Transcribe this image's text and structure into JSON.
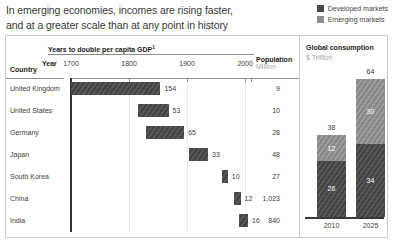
{
  "title": {
    "line1": "In emerging economies, incomes are rising faster,",
    "line2": "and at a greater scale than at any point in history"
  },
  "legend": {
    "items": [
      {
        "label": "Developed markets",
        "color": "#4a4a4a"
      },
      {
        "label": "Emerging markets",
        "color": "#8f8f8f"
      }
    ]
  },
  "chart_data": [
    {
      "type": "bar",
      "title": "Years to double per capita GDP",
      "footnote_marker": "1",
      "axis_label": "Year",
      "axis_ticks": [
        1700,
        1800,
        1900,
        2000
      ],
      "axis_range": [
        1700,
        2010
      ],
      "country_column_label": "Country",
      "population_column_label": "Population",
      "population_column_unit": "Million",
      "rows": [
        {
          "country": "United Kingdom",
          "years": 154,
          "start_year": 1700,
          "end_year": 1854,
          "population": "9"
        },
        {
          "country": "United States",
          "years": 53,
          "start_year": 1815,
          "end_year": 1868,
          "population": "10"
        },
        {
          "country": "Germany",
          "years": 65,
          "start_year": 1830,
          "end_year": 1895,
          "population": "28"
        },
        {
          "country": "Japan",
          "years": 33,
          "start_year": 1903,
          "end_year": 1936,
          "population": "48"
        },
        {
          "country": "South Korea",
          "years": 10,
          "start_year": 1960,
          "end_year": 1970,
          "population": "27"
        },
        {
          "country": "China",
          "years": 12,
          "start_year": 1980,
          "end_year": 1992,
          "population": "1,023"
        },
        {
          "country": "India",
          "years": 16,
          "start_year": 1989,
          "end_year": 2005,
          "population": "840"
        }
      ]
    },
    {
      "type": "stacked-bar",
      "title": "Global consumption",
      "unit": "$ Trillion",
      "categories": [
        "2010",
        "2025"
      ],
      "series": [
        {
          "name": "Developed markets",
          "values": [
            26,
            34
          ],
          "color": "#4a4a4a"
        },
        {
          "name": "Emerging markets",
          "values": [
            12,
            30
          ],
          "color": "#8f8f8f"
        }
      ],
      "totals": [
        38,
        64
      ]
    }
  ],
  "colors": {
    "developed": "#4a4a4a",
    "emerging": "#8f8f8f",
    "border": "#c9c9c9",
    "axis": "#8f8f8f",
    "text": "#3c3c3c"
  }
}
